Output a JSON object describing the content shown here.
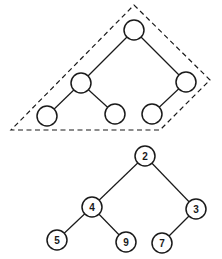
{
  "diagram": {
    "type": "binary-tree-illustration",
    "top_tree": {
      "description": "unlabeled complete binary tree shape enclosed by dashed boundary",
      "boundary": {
        "style": "dashed",
        "points": [
          [
            134,
            5
          ],
          [
            210,
            80
          ],
          [
            160,
            130
          ],
          [
            11,
            130
          ]
        ]
      },
      "nodes": [
        {
          "id": "t0",
          "x": 134,
          "y": 30,
          "label": ""
        },
        {
          "id": "t1",
          "x": 81,
          "y": 83,
          "label": ""
        },
        {
          "id": "t2",
          "x": 186,
          "y": 82,
          "label": ""
        },
        {
          "id": "t3",
          "x": 47,
          "y": 116,
          "label": ""
        },
        {
          "id": "t4",
          "x": 115,
          "y": 114,
          "label": ""
        },
        {
          "id": "t5",
          "x": 152,
          "y": 114,
          "label": ""
        }
      ],
      "edges": [
        [
          "t0",
          "t1"
        ],
        [
          "t0",
          "t2"
        ],
        [
          "t1",
          "t3"
        ],
        [
          "t1",
          "t4"
        ],
        [
          "t2",
          "t5"
        ]
      ]
    },
    "bottom_tree": {
      "description": "labeled binary tree (min-heap)",
      "nodes": [
        {
          "id": "b0",
          "x": 145,
          "y": 156,
          "label": "2"
        },
        {
          "id": "b1",
          "x": 92,
          "y": 207,
          "label": "4"
        },
        {
          "id": "b2",
          "x": 196,
          "y": 209,
          "label": "3"
        },
        {
          "id": "b3",
          "x": 57,
          "y": 240,
          "label": "5"
        },
        {
          "id": "b4",
          "x": 126,
          "y": 242,
          "label": "9"
        },
        {
          "id": "b5",
          "x": 162,
          "y": 243,
          "label": "7"
        }
      ],
      "edges": [
        [
          "b0",
          "b1"
        ],
        [
          "b0",
          "b2"
        ],
        [
          "b1",
          "b3"
        ],
        [
          "b1",
          "b4"
        ],
        [
          "b2",
          "b5"
        ]
      ]
    },
    "node_radius": 10
  }
}
